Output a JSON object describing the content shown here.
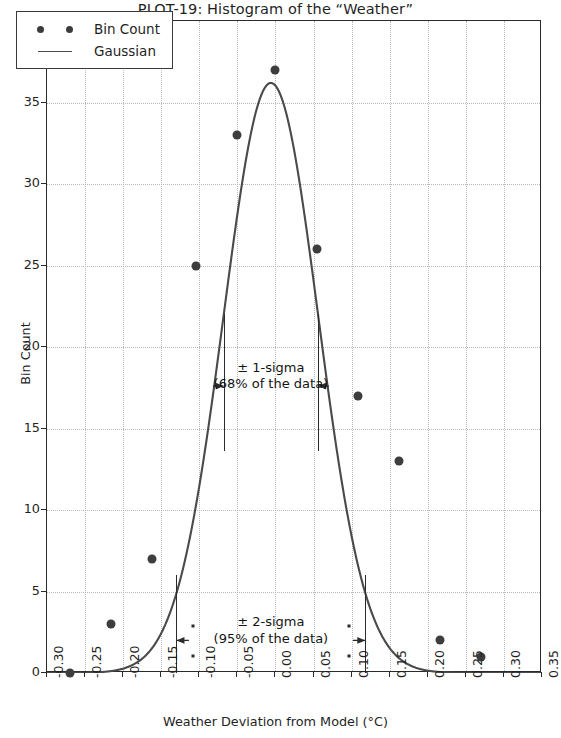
{
  "chart_data": {
    "type": "scatter",
    "title": "PLOT-19: Histogram of the “Weather”",
    "xlabel": "Weather Deviation from Model (°C)",
    "ylabel": "Bin Count",
    "xlim": [
      -0.3,
      0.35
    ],
    "ylim": [
      0,
      40
    ],
    "grid": true,
    "legend_position": "upper left",
    "xticks": [
      "-0.30",
      "-0.25",
      "-0.20",
      "-0.15",
      "-0.10",
      "-0.05",
      "0.00",
      "0.05",
      "0.10",
      "0.15",
      "0.20",
      "0.25",
      "0.30",
      "0.35"
    ],
    "xtick_values": [
      -0.3,
      -0.25,
      -0.2,
      -0.15,
      -0.1,
      -0.05,
      0.0,
      0.05,
      0.1,
      0.15,
      0.2,
      0.25,
      0.3,
      0.35
    ],
    "yticks": [
      "0",
      "5",
      "10",
      "15",
      "20",
      "25",
      "30",
      "35",
      "40"
    ],
    "ytick_values": [
      0,
      5,
      10,
      15,
      20,
      25,
      30,
      35,
      40
    ],
    "series": [
      {
        "name": "Bin Count",
        "marker": "circle",
        "color": "#3d3d3d",
        "x": [
          -0.27,
          -0.216,
          -0.162,
          -0.104,
          -0.05,
          0.0,
          0.054,
          0.108,
          0.162,
          0.216,
          0.27
        ],
        "y": [
          0,
          3,
          7,
          25,
          33,
          37,
          26,
          17,
          13,
          2,
          1
        ]
      },
      {
        "name": "Gaussian",
        "marker": "line",
        "color": "#4a4a4a",
        "amplitude": 36.2,
        "mean": -0.006,
        "sigma": 0.062
      }
    ],
    "annotations": [
      {
        "name": "one-sigma",
        "label_line1": "± 1-sigma",
        "label_line2": "(68% of the data)",
        "x_left": -0.068,
        "x_right": 0.056,
        "y": 17.6,
        "bar_top": 22.0,
        "bar_bottom": 13.6
      },
      {
        "name": "two-sigma",
        "label_line1": "± 2-sigma",
        "label_line2": "(95% of the data)",
        "x_left": -0.13,
        "x_right": 0.118,
        "y": 2.0,
        "bar_top": 6.0,
        "bar_bottom": 0.0
      }
    ]
  },
  "legend": {
    "items": [
      {
        "label": "Bin Count",
        "key": "two-dots"
      },
      {
        "label": "Gaussian",
        "key": "line"
      }
    ]
  },
  "colors": {
    "marker": "#3d3d3d",
    "curve": "#4a4a4a",
    "grid": "#b9b9c4",
    "axis": "#2a2a2a",
    "text": "#1f1f1f",
    "background": "#ffffff"
  }
}
